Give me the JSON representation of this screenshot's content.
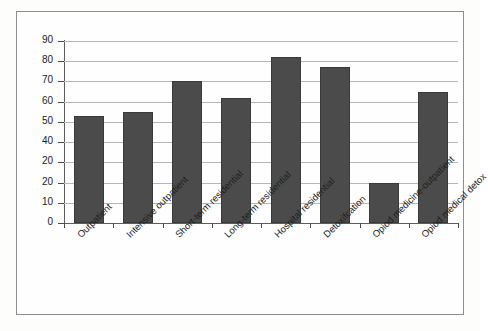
{
  "chart_data": {
    "type": "bar",
    "title": "",
    "subtitle": "",
    "xlabel": "",
    "ylabel": "",
    "grid": true,
    "legend": false,
    "ylim": [
      0,
      90
    ],
    "ytick_labels": [
      "90",
      "80",
      "70",
      "60",
      "50",
      "40",
      "20",
      "20",
      "10",
      "0"
    ],
    "ytick_values": [
      90,
      80,
      70,
      60,
      50,
      40,
      30,
      20,
      10,
      0
    ],
    "categories": [
      "Outpatient",
      "Intensive outpatient",
      "Short-term residential",
      "Long-term residential",
      "Hospital residential",
      "Detoxifcation",
      "Opiod medicine-outpatient",
      "Opiod medical detox"
    ],
    "values": [
      53,
      55,
      70,
      62,
      82,
      77,
      20,
      65
    ],
    "bar_color": "#4b4b4b",
    "grid_color": "#b6b6b6",
    "axis_color": "#5d5d5d"
  }
}
